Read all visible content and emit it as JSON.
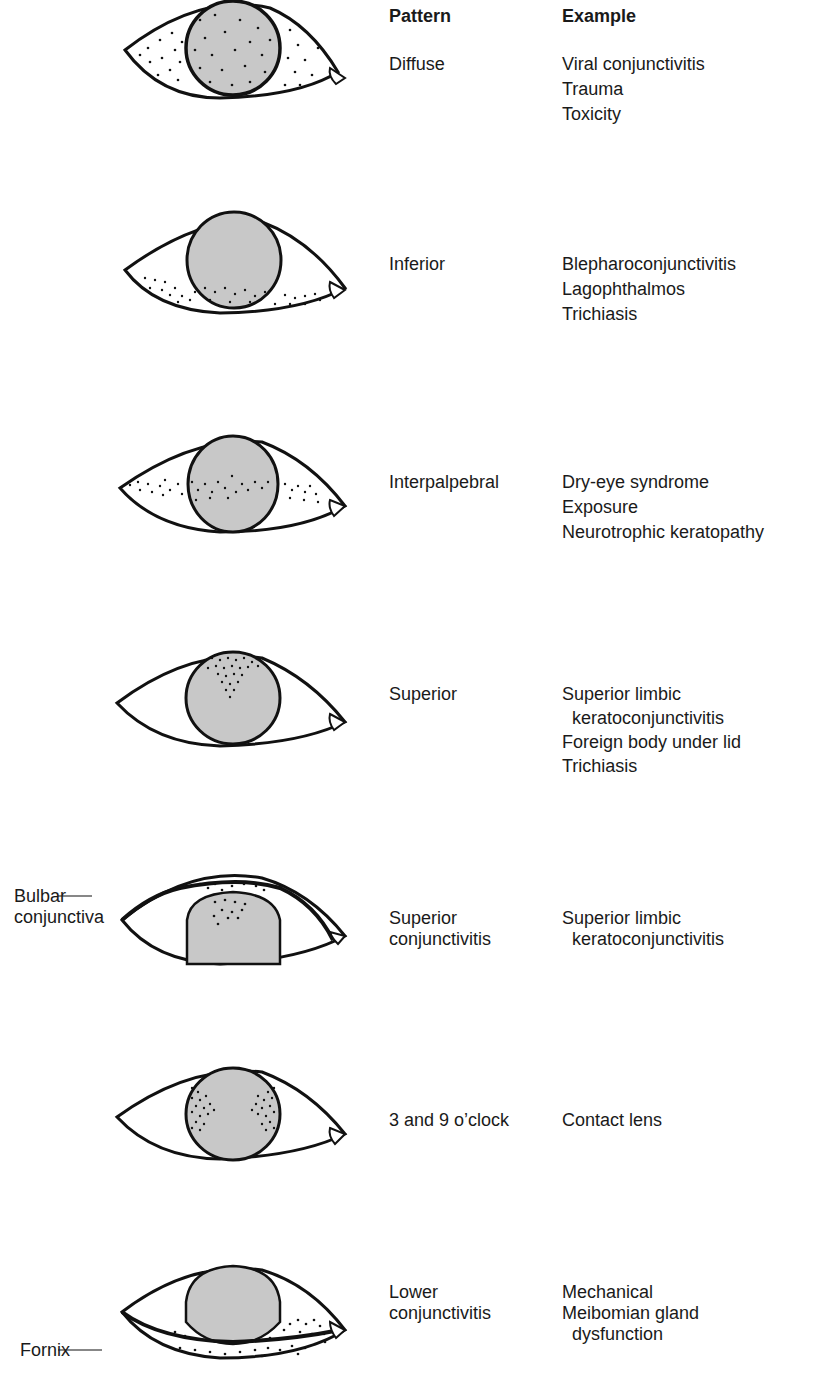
{
  "headers": {
    "pattern": "Pattern",
    "example": "Example"
  },
  "rows": [
    {
      "id": "diffuse",
      "pattern": [
        "Diffuse"
      ],
      "examples": [
        "Viral conjunctivitis",
        "Trauma",
        "Toxicity"
      ]
    },
    {
      "id": "inferior",
      "pattern": [
        "Inferior"
      ],
      "examples": [
        "Blepharoconjunctivitis",
        "Lagophthalmos",
        "Trichiasis"
      ]
    },
    {
      "id": "interpalpebral",
      "pattern": [
        "Interpalpebral"
      ],
      "examples": [
        "Dry-eye syndrome",
        "Exposure",
        "Neurotrophic keratopathy"
      ]
    },
    {
      "id": "superior",
      "pattern": [
        "Superior"
      ],
      "examples": [
        "Superior limbic",
        "  keratoconjunctivitis",
        "Foreign body under lid",
        "Trichiasis"
      ]
    },
    {
      "id": "superior-conjunctivitis",
      "pattern": [
        "Superior",
        "conjunctivitis"
      ],
      "examples": [
        "Superior limbic",
        "  keratoconjunctivitis"
      ]
    },
    {
      "id": "three-nine",
      "pattern": [
        "3 and 9 o’clock"
      ],
      "examples": [
        "Contact lens"
      ]
    },
    {
      "id": "lower-conjunctivitis",
      "pattern": [
        "Lower",
        "conjunctivitis"
      ],
      "examples": [
        "Mechanical",
        "Meibomian gland",
        "  dysfunction"
      ]
    }
  ],
  "annotations": {
    "bulbar": [
      "Bulbar",
      "conjunctiva"
    ],
    "fornix": "Fornix"
  },
  "colors": {
    "cornea_fill": "#c8c8c8",
    "line": "#111111",
    "background": "#ffffff"
  }
}
